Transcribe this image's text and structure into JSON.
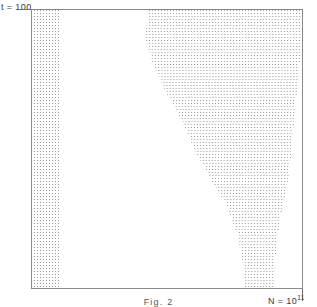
{
  "figure": {
    "caption": "Fig. 2",
    "axis_top_left_label": "t = 100",
    "axis_bottom_right_label_base": "N = 10",
    "axis_bottom_right_label_exponent": "11",
    "frame_color": "#8a8a8a",
    "stipple_color": "#9a9a9a",
    "background_color": "#ffffff"
  },
  "chart_data": {
    "type": "scatter",
    "title": "Fig. 2",
    "xlabel": "N = 10^11",
    "ylabel": "t = 100",
    "grid": false,
    "legend": null,
    "xlim": [
      0,
      1
    ],
    "ylim": [
      0,
      1
    ],
    "annotations": [
      "t = 100",
      "N = 10^11",
      "Fig. 2"
    ],
    "regions": [
      {
        "name": "left-band",
        "x_range": [
          0.0,
          0.1
        ],
        "y_range": [
          0.0,
          1.0
        ],
        "density": "uniform"
      },
      {
        "name": "main-blob",
        "density": "uniform",
        "left_boundary": [
          {
            "y": 0.0,
            "x": 0.43
          },
          {
            "y": 0.1,
            "x": 0.42
          },
          {
            "y": 0.2,
            "x": 0.45
          },
          {
            "y": 0.3,
            "x": 0.5
          },
          {
            "y": 0.4,
            "x": 0.56
          },
          {
            "y": 0.5,
            "x": 0.6
          },
          {
            "y": 0.6,
            "x": 0.66
          },
          {
            "y": 0.7,
            "x": 0.72
          },
          {
            "y": 0.8,
            "x": 0.76
          },
          {
            "y": 0.9,
            "x": 0.78
          },
          {
            "y": 1.0,
            "x": 0.79
          }
        ],
        "right_boundary": [
          {
            "y": 0.0,
            "x": 1.0
          },
          {
            "y": 0.1,
            "x": 1.0
          },
          {
            "y": 0.2,
            "x": 0.99
          },
          {
            "y": 0.3,
            "x": 0.98
          },
          {
            "y": 0.4,
            "x": 0.97
          },
          {
            "y": 0.5,
            "x": 0.96
          },
          {
            "y": 0.6,
            "x": 0.95
          },
          {
            "y": 0.7,
            "x": 0.93
          },
          {
            "y": 0.8,
            "x": 0.91
          },
          {
            "y": 0.9,
            "x": 0.9
          },
          {
            "y": 1.0,
            "x": 0.9
          }
        ]
      }
    ]
  }
}
